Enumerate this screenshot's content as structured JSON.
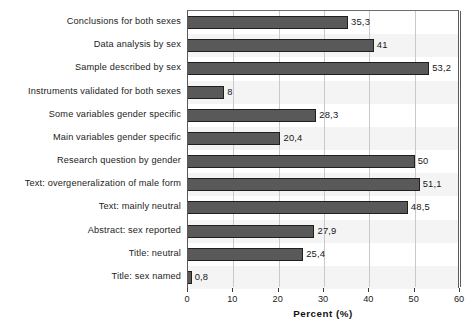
{
  "chart_data": {
    "type": "bar",
    "orientation": "horizontal",
    "title": "",
    "xlabel": "Percent (%)",
    "ylabel": "",
    "xlim": [
      0,
      60
    ],
    "xticks": [
      0,
      10,
      20,
      30,
      40,
      50,
      60
    ],
    "xtick_labels": [
      "0",
      "10",
      "20",
      "30",
      "40",
      "50",
      "60"
    ],
    "grid": "vertical",
    "legend": "none",
    "decimal_separator": ",",
    "bar_color": "#595959",
    "bar_edge_color": "#1f1f1f",
    "gridline_color": "#c9c9c9",
    "categories": [
      "Conclusions for both sexes",
      "Data analysis by sex",
      "Sample described by sex",
      "Instruments validated for both sexes",
      "Some variables gender specific",
      "Main variables gender specific",
      "Research question by gender",
      "Text: overgeneralization of male form",
      "Text: mainly neutral",
      "Abstract: sex reported",
      "Title: neutral",
      "Title: sex named"
    ],
    "values": [
      35.3,
      41,
      53.2,
      8,
      28.3,
      20.4,
      50,
      51.1,
      48.5,
      27.9,
      25.4,
      0.8
    ],
    "value_labels": [
      "35,3",
      "41",
      "53,2",
      "8",
      "28,3",
      "20,4",
      "50",
      "51,1",
      "48,5",
      "27,9",
      "25,4",
      "0,8"
    ]
  }
}
